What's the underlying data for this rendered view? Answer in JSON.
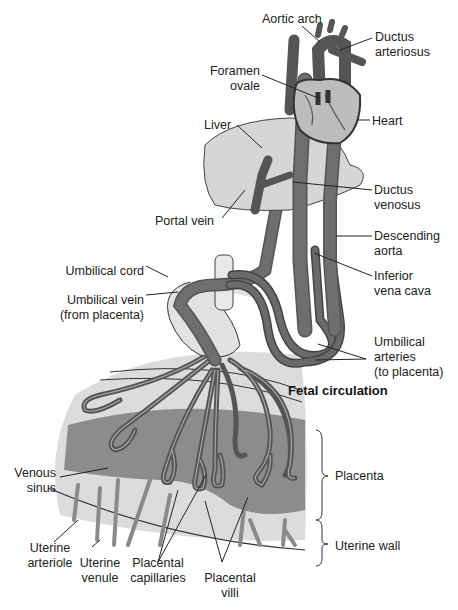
{
  "title": "Fetal circulation",
  "colors": {
    "vessel": "#666666",
    "vessel_outline": "#333333",
    "light_tissue": "#d8d8d8",
    "sinus": "#8a8a8a",
    "background": "#ffffff",
    "text": "#222222"
  },
  "labels": {
    "aortic_arch": "Aortic arch",
    "ductus_arteriosus_1": "Ductus",
    "ductus_arteriosus_2": "arteriosus",
    "foramen_ovale_1": "Foramen",
    "foramen_ovale_2": "ovale",
    "heart": "Heart",
    "liver": "Liver",
    "ductus_venosus_1": "Ductus",
    "ductus_venosus_2": "venosus",
    "portal_vein": "Portal vein",
    "descending_aorta_1": "Descending",
    "descending_aorta_2": "aorta",
    "umbilical_cord": "Umbilical cord",
    "inferior_vena_cava_1": "Inferior",
    "inferior_vena_cava_2": "vena cava",
    "umbilical_vein_1": "Umbilical vein",
    "umbilical_vein_2": "(from placenta)",
    "umbilical_arteries_1": "Umbilical",
    "umbilical_arteries_2": "arteries",
    "umbilical_arteries_3": "(to placenta)",
    "venous_sinus_1": "Venous",
    "venous_sinus_2": "sinus",
    "placenta": "Placenta",
    "uterine_wall": "Uterine wall",
    "uterine_arteriole_1": "Uterine",
    "uterine_arteriole_2": "arteriole",
    "uterine_venule_1": "Uterine",
    "uterine_venule_2": "venule",
    "placental_capillaries_1": "Placental",
    "placental_capillaries_2": "capillaries",
    "placental_villi_1": "Placental",
    "placental_villi_2": "villi"
  }
}
